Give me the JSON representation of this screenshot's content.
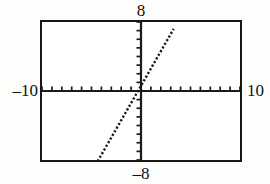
{
  "graph": {
    "title_top_label": "8",
    "title_bottom_label": "–8",
    "left_label": "–10",
    "right_label": "10"
  },
  "chart_data": {
    "type": "line",
    "title": "",
    "xlabel": "",
    "ylabel": "",
    "xlim": [
      -10,
      10
    ],
    "ylim": [
      -8,
      8
    ],
    "grid": false,
    "legend": null,
    "axis_style": "calculator-screen",
    "x_tick_interval": 1,
    "y_tick_interval": 1,
    "x_tick_values": [
      -10,
      -9,
      -8,
      -7,
      -6,
      -5,
      -4,
      -3,
      -2,
      -1,
      1,
      2,
      3,
      4,
      5,
      6,
      7,
      8,
      9,
      10
    ],
    "y_tick_values": [
      -8,
      -7,
      -6,
      -5,
      -4,
      -3,
      -2,
      -1,
      1,
      2,
      3,
      4,
      5,
      6,
      7,
      8
    ],
    "series": [
      {
        "name": "line",
        "style": "dotted",
        "color": "#1a1a1a",
        "slope": 2,
        "intercept": 0.6,
        "x": [
          -4.8,
          -4.0,
          -3.0,
          -2.0,
          -1.0,
          -0.3,
          0.0,
          1.0,
          2.0,
          3.0,
          3.3
        ],
        "values": [
          -9.0,
          -7.4,
          -5.4,
          -3.4,
          -1.4,
          0.0,
          0.6,
          2.6,
          4.6,
          6.6,
          7.2
        ],
        "x_intercept": -0.3,
        "y_intercept": 0.6,
        "x_visible_range": [
          -4.8,
          3.3
        ],
        "y_visible_range": [
          -7.9,
          7.4
        ]
      }
    ]
  }
}
